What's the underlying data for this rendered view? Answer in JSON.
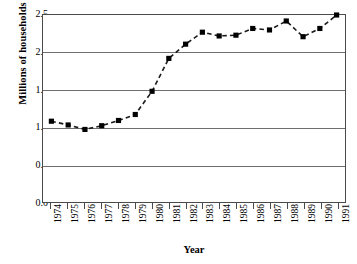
{
  "chart_data": {
    "type": "line",
    "title": "",
    "xlabel": "Year",
    "ylabel": "Millions of households",
    "categories": [
      "1974",
      "1975",
      "1976",
      "1977",
      "1978",
      "1979",
      "1980",
      "1981",
      "1982",
      "1983",
      "1984",
      "1985",
      "1986",
      "1987",
      "1988",
      "1989",
      "1990",
      "1991"
    ],
    "values": [
      1.08,
      1.03,
      0.97,
      1.02,
      1.09,
      1.17,
      1.48,
      1.92,
      2.11,
      2.27,
      2.22,
      2.23,
      2.32,
      2.3,
      2.42,
      2.21,
      2.32,
      2.5
    ],
    "series": [
      {
        "name": "Millions of households",
        "values": [
          1.08,
          1.03,
          0.97,
          1.02,
          1.09,
          1.17,
          1.48,
          1.92,
          2.11,
          2.27,
          2.22,
          2.23,
          2.32,
          2.3,
          2.42,
          2.21,
          2.32,
          2.5
        ]
      }
    ],
    "ylim": [
      0.0,
      2.5
    ],
    "ytick_labels": [
      "0.0",
      "0.5",
      "1.0",
      "1.5",
      "2.0",
      "2.5"
    ],
    "ytick_values": [
      0.0,
      0.5,
      1.0,
      1.5,
      2.0,
      2.5
    ],
    "grid": true,
    "grid_axis": "y",
    "legend": false,
    "legend_position": "none",
    "marker": "square",
    "marker_color": "#000000",
    "line_style": "dashed",
    "line_color": "#1a1a1a",
    "axis_color": "#4a4a4a",
    "gridline_color": "#6e6e6e",
    "background_color": "#ffffff",
    "xtick_rotation": -90
  }
}
